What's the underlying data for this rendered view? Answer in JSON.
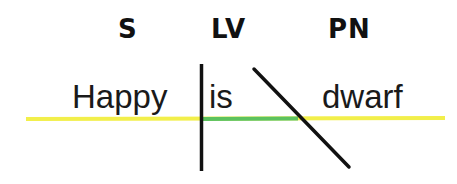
{
  "diagram": {
    "type": "sentence-diagram",
    "labels": {
      "subject": "S",
      "linking_verb": "LV",
      "predicate_nominative": "PN"
    },
    "words": {
      "subject": "Happy",
      "verb": "is",
      "complement": "dwarf"
    },
    "colors": {
      "baseline": "#f2ef4a",
      "verb_segment": "#5cc25e",
      "divider": "#111111",
      "text": "#1a1a1a"
    }
  }
}
